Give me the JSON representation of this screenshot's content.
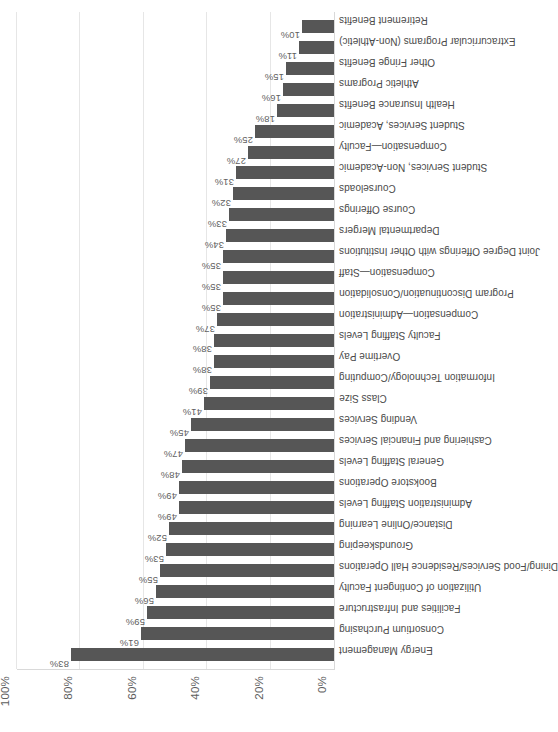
{
  "chart_data": {
    "type": "bar",
    "title": "",
    "subtitle": "",
    "xlabel": "",
    "ylabel": "",
    "ylim": [
      0,
      100
    ],
    "grid": true,
    "legend": false,
    "orientation": "vertical-rotated",
    "bar_color": "#565656",
    "y_ticks": [
      "0%",
      "20%",
      "40%",
      "60%",
      "80%",
      "100%"
    ],
    "y_tick_values": [
      0,
      20,
      40,
      60,
      80,
      100
    ],
    "categories": [
      "Energy Management",
      "Consortium Purchasing",
      "Facilities and Infrastructure",
      "Utilization of Contingent Faculty",
      "Dining/Food Services/Residence Hall Operations",
      "Groundskeeping",
      "Distance/Online Learning",
      "Administration Staffing Levels",
      "Bookstore Operations",
      "General Staffing Levels",
      "Cashiering and Financial Services",
      "Vending Services",
      "Class Size",
      "Information Technology/Computing",
      "Overtime Pay",
      "Faculty Staffing Levels",
      "Compensation—Administration",
      "Program Discontinuation/Consolidation",
      "Compensation—Staff",
      "Joint Degree Offerings with Other Institutions",
      "Departmental Mergers",
      "Course Offerings",
      "Courseloads",
      "Student Services, Non-Academic",
      "Compensation—Faculty",
      "Student Services, Academic",
      "Health Insurance Benefits",
      "Athletic Programs",
      "Other Fringe Benefits",
      "Extracurricular Programs (Non-Athletic)",
      "Retirement Benefits"
    ],
    "values": [
      83,
      61,
      59,
      56,
      55,
      53,
      52,
      49,
      49,
      48,
      47,
      45,
      41,
      39,
      38,
      38,
      37,
      35,
      35,
      35,
      34,
      33,
      32,
      31,
      27,
      25,
      18,
      16,
      15,
      11,
      10
    ],
    "value_labels": [
      "83%",
      "61%",
      "59%",
      "56%",
      "55%",
      "53%",
      "52%",
      "49%",
      "49%",
      "48%",
      "47%",
      "45%",
      "41%",
      "39%",
      "38%",
      "38%",
      "37%",
      "35%",
      "35%",
      "35%",
      "34%",
      "33%",
      "32%",
      "31%",
      "27%",
      "25%",
      "18%",
      "16%",
      "15%",
      "11%",
      "10%"
    ]
  }
}
